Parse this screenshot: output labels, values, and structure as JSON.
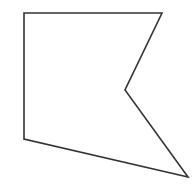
{
  "figure": {
    "type": "polygon-outline",
    "shape": "concave pentagon",
    "background_color": "#ffffff",
    "stroke_color": "#333333",
    "stroke_width": 1.6,
    "fill": "none",
    "vertices": [
      {
        "label": "top-left",
        "x": 24,
        "y": 13
      },
      {
        "label": "top-right",
        "x": 162,
        "y": 13
      },
      {
        "label": "inner-notch",
        "x": 125,
        "y": 90
      },
      {
        "label": "bottom-right",
        "x": 188,
        "y": 177
      },
      {
        "label": "bottom-left",
        "x": 24,
        "y": 139
      }
    ]
  }
}
